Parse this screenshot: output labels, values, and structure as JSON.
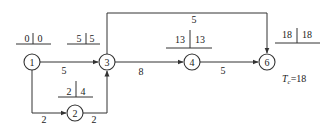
{
  "diagram": {
    "type": "activity-on-arrow network (critical path)",
    "nodes": [
      {
        "id": "1",
        "label": "1",
        "time_box": {
          "earliest": "0",
          "latest": "0"
        }
      },
      {
        "id": "2",
        "label": "2",
        "time_box": {
          "earliest": "2",
          "latest": "4"
        }
      },
      {
        "id": "3",
        "label": "3",
        "time_box": {
          "earliest": "5",
          "latest": "5"
        }
      },
      {
        "id": "4",
        "label": "4",
        "time_box": {
          "earliest": "13",
          "latest": "13"
        }
      },
      {
        "id": "6",
        "label": "6",
        "time_box": {
          "earliest": "18",
          "latest": "18"
        }
      }
    ],
    "edges": [
      {
        "from": "1",
        "to": "3",
        "duration": "5"
      },
      {
        "from": "1",
        "to": "2",
        "duration": "2"
      },
      {
        "from": "2",
        "to": "3",
        "duration": "2"
      },
      {
        "from": "3",
        "to": "4",
        "duration": "8"
      },
      {
        "from": "4",
        "to": "6",
        "duration": "5"
      },
      {
        "from": "3",
        "to": "6",
        "duration": "5"
      }
    ],
    "total_time": {
      "symbol": "T",
      "subscript": "c",
      "equals": "=18"
    }
  }
}
